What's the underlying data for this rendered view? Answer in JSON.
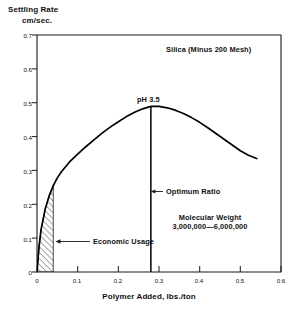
{
  "chart_data": {
    "type": "line",
    "title": "",
    "subtitle": "",
    "xlabel": "Polymer Added, lbs./ton",
    "ylabel": "Settling Rate",
    "ylabel_units": "cm/sec.",
    "xlim": [
      0,
      0.6
    ],
    "ylim": [
      0,
      0.7
    ],
    "grid": false,
    "legend": "none",
    "xticks": [
      "0",
      "0.1",
      "0.2",
      "0.3",
      "0.4",
      "0.5",
      "0.6"
    ],
    "xtick_values": [
      0,
      0.1,
      0.2,
      0.3,
      0.4,
      0.5,
      0.6
    ],
    "yticks": [
      "0",
      "0.1",
      "0.2",
      "0.3",
      "0.4",
      "0.5",
      "0.6",
      "0.7"
    ],
    "ytick_values": [
      0,
      0.1,
      0.2,
      0.3,
      0.4,
      0.5,
      0.6,
      0.7
    ],
    "series": [
      {
        "name": "Settling Rate vs Polymer Added",
        "x": [
          0.0,
          0.005,
          0.01,
          0.02,
          0.03,
          0.04,
          0.05,
          0.06,
          0.08,
          0.1,
          0.12,
          0.14,
          0.16,
          0.18,
          0.2,
          0.22,
          0.24,
          0.26,
          0.28,
          0.3,
          0.32,
          0.34,
          0.36,
          0.38,
          0.4,
          0.42,
          0.44,
          0.46,
          0.48,
          0.5,
          0.52,
          0.54
        ],
        "y": [
          0.0,
          0.075,
          0.125,
          0.185,
          0.225,
          0.255,
          0.278,
          0.296,
          0.325,
          0.348,
          0.37,
          0.39,
          0.41,
          0.428,
          0.444,
          0.459,
          0.472,
          0.482,
          0.489,
          0.489,
          0.485,
          0.478,
          0.468,
          0.456,
          0.442,
          0.426,
          0.409,
          0.392,
          0.375,
          0.358,
          0.345,
          0.335
        ]
      }
    ],
    "optimum_marker": {
      "x": 0.28,
      "y_top": 0.489,
      "y_bottom": 0.0,
      "label": "pH 3.5"
    },
    "shaded_region": {
      "label": "Economic Usage",
      "x_start": 0.0,
      "x_end": 0.04,
      "pattern": "diagonal-hatch"
    },
    "annotations": [
      {
        "name": "sample-label",
        "text": "Silica (Minus 200 Mesh)"
      },
      {
        "name": "ph-label",
        "text": "pH 3.5"
      },
      {
        "name": "optimum-ratio-label",
        "text": "Optimum Ratio"
      },
      {
        "name": "molecular-weight-label-line1",
        "text": "Molecular Weight"
      },
      {
        "name": "molecular-weight-label-line2",
        "text": "3,000,000—6,000,000"
      },
      {
        "name": "economic-usage-label",
        "text": "Economic Usage"
      }
    ],
    "colors": {
      "background": "#ffffff",
      "axis": "#1a1a1a",
      "curve": "#000000",
      "text": "#111111",
      "hatch": "#3a3a3a"
    }
  }
}
